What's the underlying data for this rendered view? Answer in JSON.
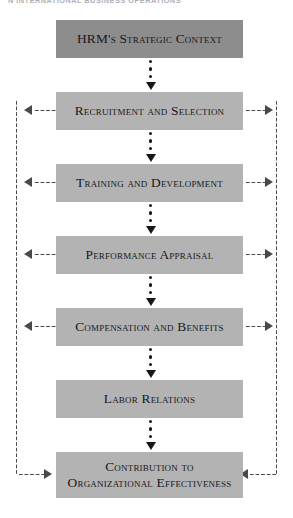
{
  "page": {
    "running_header": "N INTERNATIONAL BUSINESS OPERATIONS"
  },
  "diagram": {
    "type": "flowchart",
    "colors": {
      "box_fill": "#b3b3b3",
      "box_fill_top": "#8d8d8d",
      "text": "#17171c",
      "connector": "#171717",
      "feedback": "#4a4a4a",
      "background": "#ffffff"
    },
    "nodes": [
      {
        "id": "n1",
        "label": "HRM's Strategic Context",
        "style": "dark",
        "top": 20,
        "height": 38
      },
      {
        "id": "n2",
        "label": "Recruitment and Selection",
        "style": "light",
        "top": 92,
        "height": 38
      },
      {
        "id": "n3",
        "label": "Training and Development",
        "style": "light",
        "top": 164,
        "height": 38
      },
      {
        "id": "n4",
        "label": "Performance Appraisal",
        "style": "light",
        "top": 236,
        "height": 38
      },
      {
        "id": "n5",
        "label": "Compensation and Benefits",
        "style": "light",
        "top": 308,
        "height": 38
      },
      {
        "id": "n6",
        "label": "Labor Relations",
        "style": "light",
        "top": 380,
        "height": 38
      },
      {
        "id": "n7",
        "label": "Contribution to\nOrganizational Effectiveness",
        "style": "light",
        "top": 452,
        "height": 46
      }
    ],
    "node_labels": {
      "n1": "HRM's Strategic Context",
      "n2": "Recruitment and Selection",
      "n3": "Training and Development",
      "n4": "Performance Appraisal",
      "n5": "Compensation and Benefits",
      "n6": "Labor Relations",
      "n7_line1": "Contribution to",
      "n7_line2": "Organizational Effectiveness"
    },
    "sequence_connectors": [
      {
        "from": "n1",
        "to": "n2",
        "marker": "dotted-arrow-down"
      },
      {
        "from": "n2",
        "to": "n3",
        "marker": "dotted-arrow-down"
      },
      {
        "from": "n3",
        "to": "n4",
        "marker": "dotted-arrow-down"
      },
      {
        "from": "n4",
        "to": "n5",
        "marker": "dotted-arrow-down"
      },
      {
        "from": "n5",
        "to": "n6",
        "marker": "dotted-arrow-down"
      },
      {
        "from": "n6",
        "to": "n7",
        "marker": "dotted-arrow-down"
      }
    ],
    "feedback_loops": [
      {
        "side": "left",
        "from": "n7",
        "to": "n2",
        "direction": "into-box"
      },
      {
        "side": "left",
        "from": "n7",
        "to": "n3",
        "direction": "into-box"
      },
      {
        "side": "left",
        "from": "n7",
        "to": "n4",
        "direction": "into-box"
      },
      {
        "side": "left",
        "from": "n7",
        "to": "n5",
        "direction": "into-box"
      },
      {
        "side": "right",
        "from": "n7",
        "to": "n2",
        "direction": "into-rail"
      },
      {
        "side": "right",
        "from": "n7",
        "to": "n3",
        "direction": "into-rail"
      },
      {
        "side": "right",
        "from": "n7",
        "to": "n4",
        "direction": "into-rail"
      },
      {
        "side": "right",
        "from": "n7",
        "to": "n5",
        "direction": "into-rail"
      }
    ]
  }
}
